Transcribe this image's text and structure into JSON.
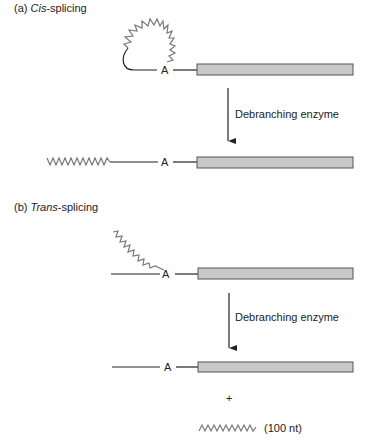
{
  "panels": [
    {
      "id": "a",
      "title_prefix": "(a) ",
      "title_italic": "Cis",
      "title_suffix": "-splicing",
      "branch_label": "A",
      "enzyme_label": "Debranching enzyme",
      "product_branch_label": "A"
    },
    {
      "id": "b",
      "title_prefix": "(b) ",
      "title_italic": "Trans",
      "title_suffix": "-splicing",
      "branch_label": "A",
      "enzyme_label": "Debranching enzyme",
      "product_branch_label": "A",
      "plus_sign": "+",
      "released_fragment_label": "(100 nt)"
    }
  ],
  "colors": {
    "exon_fill": "#c9c9c9",
    "exon_stroke": "#555555",
    "zigzag": "#777777",
    "line": "#222222"
  }
}
